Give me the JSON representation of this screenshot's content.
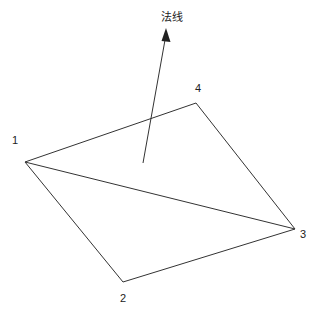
{
  "diagram": {
    "normal_label": "法线",
    "vertices": [
      {
        "id": "1",
        "label": "1",
        "x": 25,
        "y": 162,
        "lx": 12,
        "ly": 144
      },
      {
        "id": "2",
        "label": "2",
        "x": 123,
        "y": 282,
        "lx": 120,
        "ly": 302
      },
      {
        "id": "3",
        "label": "3",
        "x": 295,
        "y": 229,
        "lx": 300,
        "ly": 238
      },
      {
        "id": "4",
        "label": "4",
        "x": 196,
        "y": 103,
        "lx": 195,
        "ly": 92
      }
    ],
    "normal_arrow": {
      "x1": 143,
      "y1": 163,
      "x2": 166,
      "y2": 33
    },
    "stroke_color": "#333333"
  }
}
